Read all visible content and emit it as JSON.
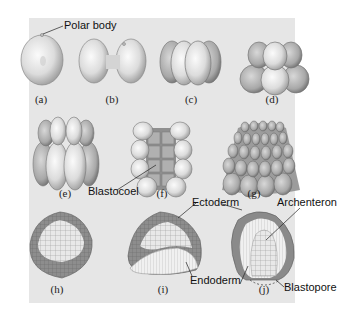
{
  "figure": {
    "background": "#e6e6e6",
    "stages": [
      {
        "id": "a",
        "caption": "(a)",
        "description": "zygote with polar body"
      },
      {
        "id": "b",
        "caption": "(b)",
        "description": "2-cell stage"
      },
      {
        "id": "c",
        "caption": "(c)",
        "description": "4-cell stage"
      },
      {
        "id": "d",
        "caption": "(d)",
        "description": "8-cell stage"
      },
      {
        "id": "e",
        "caption": "(e)",
        "description": "16-cell stage"
      },
      {
        "id": "f",
        "caption": "(f)",
        "description": "cross-section showing blastocoel"
      },
      {
        "id": "g",
        "caption": "(g)",
        "description": "morula / blastula"
      },
      {
        "id": "h",
        "caption": "(h)",
        "description": "blastula section"
      },
      {
        "id": "i",
        "caption": "(i)",
        "description": "early gastrula"
      },
      {
        "id": "j",
        "caption": "(j)",
        "description": "gastrula with archenteron"
      }
    ],
    "labels": {
      "polar_body": "Polar body",
      "blastocoel": "Blastocoel",
      "ectoderm": "Ectoderm",
      "archenteron": "Archenteron",
      "endoderm": "Endoderm",
      "blastopore": "Blastopore"
    }
  }
}
